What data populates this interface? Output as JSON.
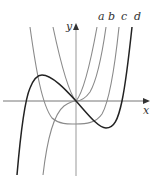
{
  "figure": {
    "axes": {
      "x_label": "x",
      "y_label": "y",
      "origin": [
        76,
        101
      ]
    },
    "curves": [
      {
        "label": "a",
        "color": "#8a8a8a",
        "label_pos": [
          98,
          20
        ],
        "path": "M53,27 C60,60 68,92 76,101 C84,92 91,60 97,27"
      },
      {
        "label": "b",
        "color": "#8a8a8a",
        "label_pos": [
          108,
          20
        ],
        "path": "M43,175 C47,140 54,114 64,106 C70,102 74,101 76,101 C80,101 85,99 90,92 C97,80 102,55 106,27"
      },
      {
        "label": "c",
        "color": "#8a8a8a",
        "label_pos": [
          121,
          20
        ],
        "path": "M30,27 C36,70 42,105 52,118 C60,125 70,124 76,124 C86,124 96,123 102,114 C110,100 115,65 119,27"
      },
      {
        "label": "d",
        "color": "#222222",
        "label_pos": [
          134,
          20
        ],
        "path": "M17,175 C20,140 24,102 30,88 C34,78 38,75 42,75 C52,75 66,90 76,101 C86,112 98,128 106,128 C114,128 118,120 122,101 C126,82 129,55 132,27"
      }
    ]
  }
}
